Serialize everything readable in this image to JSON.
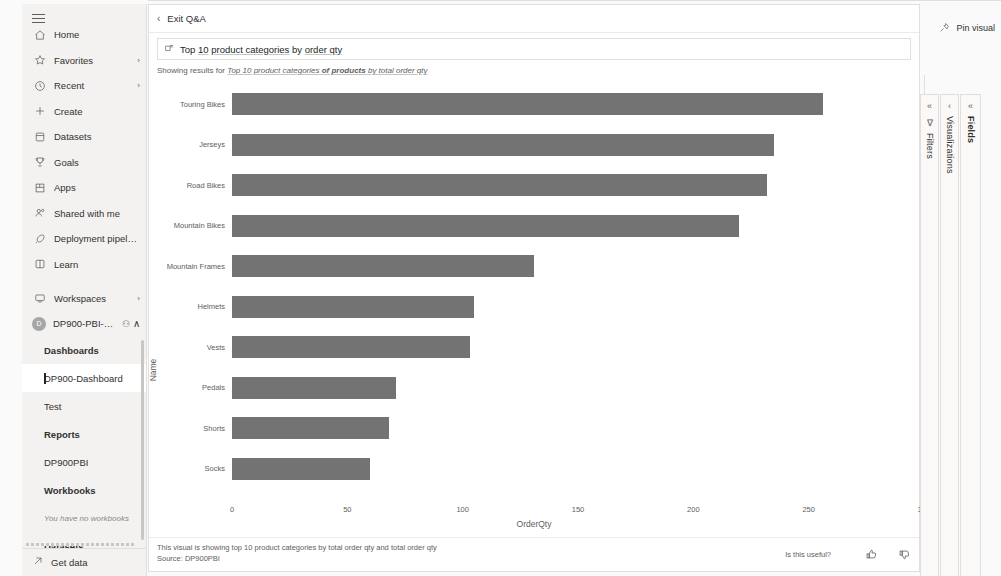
{
  "sidebar": {
    "menu_icon": "hamburger-icon",
    "items": [
      {
        "label": "Home",
        "icon": "home-icon",
        "chevron": ""
      },
      {
        "label": "Favorites",
        "icon": "star-icon",
        "chevron": "›"
      },
      {
        "label": "Recent",
        "icon": "clock-icon",
        "chevron": "›"
      },
      {
        "label": "Create",
        "icon": "plus-icon",
        "chevron": ""
      },
      {
        "label": "Datasets",
        "icon": "dataset-icon",
        "chevron": ""
      },
      {
        "label": "Goals",
        "icon": "trophy-icon",
        "chevron": ""
      },
      {
        "label": "Apps",
        "icon": "apps-grid-icon",
        "chevron": ""
      },
      {
        "label": "Shared with me",
        "icon": "people-icon",
        "chevron": ""
      },
      {
        "label": "Deployment pipelines",
        "icon": "rocket-icon",
        "chevron": ""
      },
      {
        "label": "Learn",
        "icon": "book-icon",
        "chevron": ""
      }
    ],
    "workspaces": {
      "label": "Workspaces",
      "icon": "workspace-icon",
      "chevron": "›"
    },
    "active_workspace": {
      "name": "DP900-PBI-Work...",
      "avatar_initials": "D",
      "badge": "⚇",
      "chevron": "∧"
    },
    "tree": [
      {
        "label": "Dashboards",
        "style": "bold"
      },
      {
        "label": "DP900-Dashboard",
        "style": "selected"
      },
      {
        "label": "Test",
        "style": "normal"
      },
      {
        "label": "Reports",
        "style": "bold"
      },
      {
        "label": "DP900PBI",
        "style": "normal"
      },
      {
        "label": "Workbooks",
        "style": "bold"
      },
      {
        "label": "You have no workbooks",
        "style": "muted"
      },
      {
        "label": "Datasets",
        "style": "bold"
      }
    ],
    "get_data": {
      "label": "Get data",
      "icon": "arrow-up-right-icon"
    }
  },
  "header": {
    "exit_qa_label": "Exit Q&A",
    "back_chevron": "‹",
    "pin_visual_label": "Pin visual",
    "pin_icon": "pin-icon"
  },
  "query": {
    "icon": "qa-box-icon",
    "prefix": "Top ",
    "underlined_1": "10",
    "mid": " ",
    "underlined_2": "product categories",
    "suffix_plain": " by ",
    "underlined_3": "order qty"
  },
  "showing": {
    "prefix": "Showing results for ",
    "part1": "Top 10 product categories",
    "part2": " of products",
    "part3": " by total order qty"
  },
  "chart_data": {
    "type": "bar",
    "orientation": "horizontal",
    "title": "",
    "xlabel": "OrderQty",
    "ylabel": "Name",
    "xlim": [
      0,
      300
    ],
    "xticks": [
      0,
      50,
      100,
      150,
      200,
      250,
      300
    ],
    "grid": false,
    "bar_color": "#737373",
    "categories": [
      "Touring Bikes",
      "Jerseys",
      "Road Bikes",
      "Mountain Bikes",
      "Mountain Frames",
      "Helmets",
      "Vests",
      "Pedals",
      "Shorts",
      "Socks"
    ],
    "values": [
      256,
      235,
      232,
      220,
      131,
      105,
      103,
      71,
      68,
      60
    ]
  },
  "visual_footer": {
    "line1": "This visual is showing top 10 product categories by total order qty and total order qty",
    "line2": "Source: DP900PBI",
    "feedback_question": "Is this useful?",
    "thumbs_up_icon": "thumbs-up-icon",
    "thumbs_down_icon": "thumbs-down-icon"
  },
  "right_panels": [
    {
      "name": "Filters",
      "expand_icon": "«",
      "extra_icon": "∇",
      "bold": false
    },
    {
      "name": "Visualizations",
      "expand_icon": "‹",
      "extra_icon": "",
      "bold": false
    },
    {
      "name": "Fields",
      "expand_icon": "«",
      "extra_icon": "",
      "bold": true
    }
  ]
}
